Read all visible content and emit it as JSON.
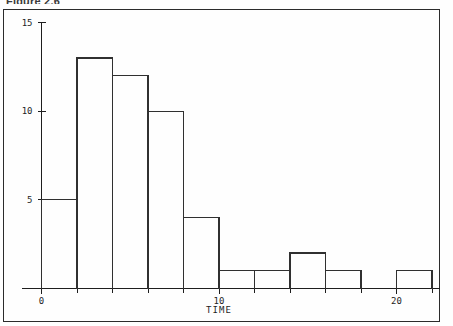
{
  "caption": {
    "text": "Figure 2.6"
  },
  "chart_data": {
    "type": "bar",
    "title": "",
    "subtitle": "",
    "xlabel": "TIME",
    "ylabel": "",
    "grid": false,
    "legend": "none",
    "bin_width": 2,
    "bin_starts": [
      0,
      2,
      4,
      6,
      8,
      10,
      12,
      14,
      16,
      18,
      20
    ],
    "bin_ends": [
      2,
      4,
      6,
      8,
      10,
      12,
      14,
      16,
      18,
      20,
      22
    ],
    "categories": [
      "0-2",
      "2-4",
      "4-6",
      "6-8",
      "8-10",
      "10-12",
      "12-14",
      "14-16",
      "16-18",
      "18-20",
      "20-22"
    ],
    "values": [
      5,
      13,
      12,
      10,
      4,
      1,
      1,
      2,
      1,
      0,
      1
    ],
    "xlim": [
      -1,
      23
    ],
    "ylim": [
      0,
      15.8
    ],
    "x_major_ticks": [
      0,
      10,
      20
    ],
    "x_major_tick_labels": [
      "0",
      "10",
      "20"
    ],
    "x_minor_ticks": [
      2,
      4,
      6,
      8,
      12,
      14,
      16,
      18,
      22
    ],
    "y_major_ticks": [
      5,
      10,
      15
    ],
    "y_major_tick_labels": [
      "5",
      "10",
      "15"
    ]
  },
  "axes": {
    "y_tick_labels": [
      "15",
      "10",
      "5"
    ],
    "x_tick_labels": [
      "0",
      "10",
      "20"
    ],
    "x_axis_title": "TIME"
  }
}
